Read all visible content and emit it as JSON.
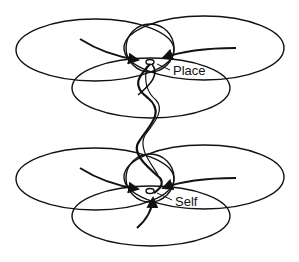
{
  "diagram": {
    "labels": {
      "place": "Place",
      "self": "Self"
    },
    "colors": {
      "stroke": "#111111",
      "background": "#ffffff"
    },
    "groups": [
      {
        "name": "place-network",
        "offset_y": 0
      },
      {
        "name": "self-network",
        "offset_y": 130
      }
    ],
    "connector": "twisted-strand"
  }
}
